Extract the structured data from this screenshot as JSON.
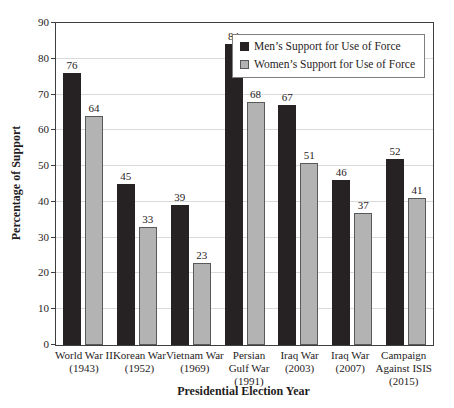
{
  "chart_data": {
    "type": "bar",
    "categories": [
      [
        "World War II",
        "(1943)"
      ],
      [
        "Korean War",
        "(1952)"
      ],
      [
        "Vietnam War",
        "(1969)"
      ],
      [
        "Persian",
        "Gulf War",
        "(1991)"
      ],
      [
        "Iraq War",
        "(2003)"
      ],
      [
        "Iraq War",
        "(2007)"
      ],
      [
        "Campaign",
        "Against ISIS",
        "(2015)"
      ]
    ],
    "series": [
      {
        "name": "Men’s Support for Use of Force",
        "color": "#262122",
        "border": "#262122",
        "values": [
          76,
          45,
          39,
          84,
          67,
          46,
          52
        ]
      },
      {
        "name": "Women’s Support for Use of Force",
        "color": "#b3b3b3",
        "border": "#58595b",
        "values": [
          64,
          33,
          23,
          68,
          51,
          37,
          41
        ]
      }
    ],
    "xlabel": "Presidential Election Year",
    "ylabel": "Percentage of Support",
    "ylim": [
      0,
      90
    ],
    "ytick_step": 10,
    "grid": true,
    "legend_position": "top-right",
    "colors": {
      "frame": "#3f3f3f",
      "gridline": "#dadada",
      "text": "#1f1c1d",
      "legend_border": "#7f7f7f"
    }
  }
}
